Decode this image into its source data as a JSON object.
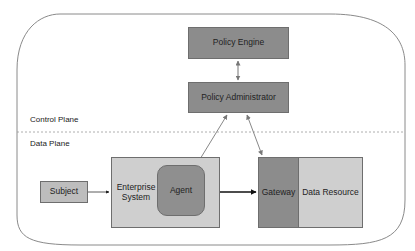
{
  "diagram": {
    "title": "",
    "planes": {
      "control": "Control Plane",
      "data": "Data Plane"
    },
    "nodes": {
      "policy_engine": "Policy Engine",
      "policy_administrator": "Policy Administrator",
      "subject": "Subject",
      "enterprise_system": "Enterprise System",
      "agent": "Agent",
      "gateway": "Gateway",
      "data_resource": "Data Resource"
    },
    "edges": [
      {
        "from": "Policy Engine",
        "to": "Policy Administrator",
        "type": "bidirectional"
      },
      {
        "from": "Policy Administrator",
        "to": "Agent",
        "type": "bidirectional"
      },
      {
        "from": "Policy Administrator",
        "to": "Gateway",
        "type": "bidirectional"
      },
      {
        "from": "Subject",
        "to": "Enterprise System",
        "type": "directed"
      },
      {
        "from": "Agent",
        "to": "Gateway",
        "type": "bidirectional-bold"
      }
    ],
    "colors": {
      "dark_box": "#8c8c8c",
      "medium_box": "#a9a9a9",
      "light_box": "#cfcfcf",
      "outline": "#7a7a7a"
    }
  }
}
